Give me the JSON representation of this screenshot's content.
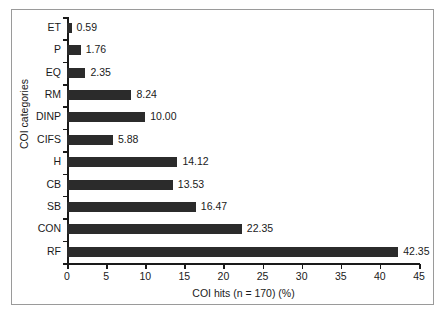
{
  "chart_data": {
    "type": "bar",
    "orientation": "horizontal",
    "title": "",
    "xlabel": "COI hits (n = 170) (%)",
    "ylabel": "COI categories",
    "categories": [
      "ET",
      "P",
      "EQ",
      "RM",
      "DINP",
      "CIFS",
      "H",
      "CB",
      "SB",
      "CON",
      "RF"
    ],
    "values": [
      0.59,
      1.76,
      2.35,
      8.24,
      10.0,
      5.88,
      14.12,
      13.53,
      16.47,
      22.35,
      42.35
    ],
    "value_labels": [
      "0.59",
      "1.76",
      "2.35",
      "8.24",
      "10.00",
      "5.88",
      "14.12",
      "13.53",
      "16.47",
      "22.35",
      "42.35"
    ],
    "xlim": [
      0,
      45
    ],
    "xticks": [
      0,
      5,
      10,
      15,
      20,
      25,
      30,
      35,
      40,
      45
    ],
    "xtick_labels": [
      "0",
      "5",
      "10",
      "15",
      "20",
      "25",
      "30",
      "35",
      "40",
      "45"
    ],
    "grid": false,
    "legend": null,
    "bar_color": "#2b2b2b",
    "axis_color": "#1a1a1a",
    "background_color": "#ffffff",
    "frame_color": "#9a9a9a"
  }
}
